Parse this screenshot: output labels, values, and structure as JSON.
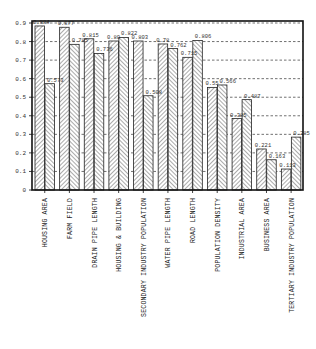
{
  "chart_data": {
    "type": "bar",
    "title": "",
    "xlabel": "",
    "ylabel": "",
    "ylim": [
      0,
      0.9
    ],
    "yticks": [
      "0",
      "0.1",
      "0.2",
      "0.3",
      "0.4",
      "0.5",
      "0.6",
      "0.7",
      "0.8",
      "0.9"
    ],
    "grid": "horizontal dashed",
    "legend": "none",
    "categories": [
      "HOUSING AREA",
      "FARM FIELD",
      "DRAIN PIPE LENGTH",
      "HOUSING & BUILDING",
      "SECONDARY INDUSTRY POPULATION",
      "WATER PIPE LENGTH",
      "ROAD LENGTH",
      "POPULATION DENSITY",
      "INDUSTRIAL AREA",
      "BUSINESS AREA",
      "TERTIARY INDUSTRY POPULATION"
    ],
    "series": [
      {
        "name": "Series 1 (forward hatch)",
        "values": [
          0.884,
          0.877,
          0.815,
          0.803,
          0.803,
          0.787,
          0.715,
          0.553,
          0.385,
          0.221,
          0.113
        ],
        "labels": [
          "0.884",
          "0.877",
          "0.815",
          "0.80",
          "0.803",
          "0.78",
          "0.715",
          "0.55",
          "0.385",
          "0.221",
          "0.113"
        ]
      },
      {
        "name": "Series 2 (back hatch)",
        "values": [
          0.573,
          0.785,
          0.736,
          0.822,
          0.508,
          0.762,
          0.806,
          0.566,
          0.487,
          0.163,
          0.285
        ],
        "labels": [
          "0.573",
          "0.785",
          "0.736",
          "0.822",
          "0.508",
          "0.762",
          "0.806",
          "0.566",
          "0.487",
          "0.163",
          "0.285"
        ]
      }
    ]
  },
  "colors": {
    "frame": "#111111",
    "bar_fill": "#ffffff",
    "hatch": "#444444",
    "grid": "#333333"
  }
}
